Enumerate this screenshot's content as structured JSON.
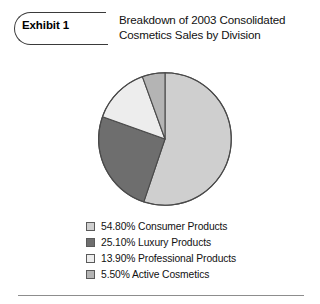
{
  "exhibit": {
    "tag_label": "Exhibit 1",
    "title_line_1": "Breakdown of 2003 Consolidated",
    "title_line_2": "Cosmetics Sales by Division"
  },
  "chart_data": {
    "type": "pie",
    "title": "Breakdown of 2003 Consolidated Cosmetics Sales by Division",
    "subtitle": "",
    "xlabel": "",
    "ylabel": "",
    "units": "percent",
    "legend_position": "bottom",
    "grid": false,
    "start_angle_deg": 0,
    "direction": "clockwise",
    "categories": [
      "Consumer Products",
      "Luxury Products",
      "Professional Products",
      "Active Cosmetics"
    ],
    "values": [
      54.8,
      25.1,
      13.9,
      5.5
    ],
    "value_labels": [
      "54.80%",
      "25.10%",
      "13.90%",
      "5.50%"
    ],
    "colors": [
      "#cfcfcf",
      "#6e6e6e",
      "#ededed",
      "#b4b4b4"
    ],
    "slice_outline_color": "#4a4a4a",
    "slices": [
      {
        "label": "Consumer Products",
        "value": 54.8,
        "value_label": "54.80%",
        "color": "#cfcfcf"
      },
      {
        "label": "Luxury Products",
        "value": 25.1,
        "value_label": "25.10%",
        "color": "#6e6e6e"
      },
      {
        "label": "Professional Products",
        "value": 13.9,
        "value_label": "13.90%",
        "color": "#ededed"
      },
      {
        "label": "Active Cosmetics",
        "value": 5.5,
        "value_label": "5.50%",
        "color": "#b4b4b4"
      }
    ]
  },
  "legend": {
    "items": [
      {
        "text": "54.80% Consumer Products",
        "color": "#cfcfcf"
      },
      {
        "text": "25.10% Luxury Products",
        "color": "#6e6e6e"
      },
      {
        "text": "13.90% Professional Products",
        "color": "#ededed"
      },
      {
        "text": "5.50% Active Cosmetics",
        "color": "#b4b4b4"
      }
    ]
  }
}
